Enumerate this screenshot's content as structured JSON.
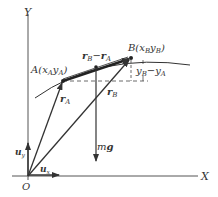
{
  "axes": {
    "x_label": "X",
    "y_label": "Y",
    "origin_label": "O"
  },
  "points": {
    "A": {
      "name": "A",
      "coords": "(x",
      "sub1": "A",
      "mid": "y",
      "sub2": "A",
      "close": ")"
    },
    "B": {
      "name": "B",
      "coords": "(x",
      "sub1": "B",
      "mid": "y",
      "sub2": "B",
      "close": ")"
    }
  },
  "vectors": {
    "rA": {
      "main": "r",
      "sub": "A"
    },
    "rB": {
      "main": "r",
      "sub": "B"
    },
    "diff": {
      "r1": "r",
      "s1": "B",
      "minus": "−",
      "r2": "r",
      "s2": "A"
    },
    "ux": {
      "main": "u",
      "sub": "x"
    },
    "uy": {
      "main": "u",
      "sub": "y"
    },
    "mg": {
      "m": "m",
      "g": "g"
    }
  },
  "delta_y": {
    "y1": "y",
    "s1": "B",
    "minus": "−",
    "y2": "y",
    "s2": "A"
  }
}
